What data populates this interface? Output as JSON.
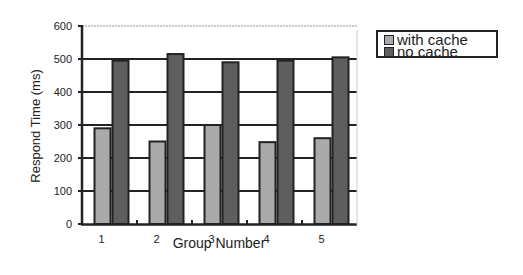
{
  "chart_data": {
    "type": "bar",
    "title": "",
    "xlabel": "Group Number",
    "ylabel": "Respond Time (ms)",
    "categories": [
      "1",
      "2",
      "3",
      "4",
      "5"
    ],
    "series": [
      {
        "name": "with cache",
        "color": "#aaaaaa",
        "values": [
          290,
          250,
          300,
          248,
          260
        ]
      },
      {
        "name": "no cache",
        "color": "#5e5e5e",
        "values": [
          495,
          515,
          490,
          495,
          505
        ]
      }
    ],
    "ylim": [
      0,
      600
    ],
    "yticks": [
      "0",
      "100",
      "200",
      "300",
      "400",
      "500",
      "600"
    ],
    "grid": true,
    "legend_position": "right"
  }
}
